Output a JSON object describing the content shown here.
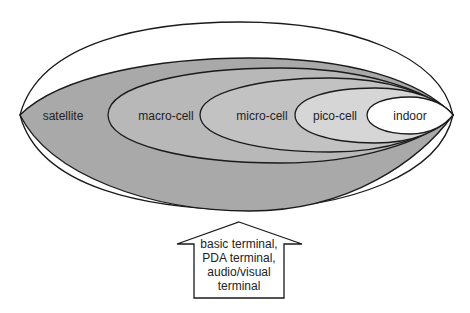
{
  "diagram": {
    "layers": [
      {
        "label": "satellite",
        "color": "#a9a9a9"
      },
      {
        "label": "macro-cell",
        "color": "#b8b8b8"
      },
      {
        "label": "micro-cell",
        "color": "#c2c2c2"
      },
      {
        "label": "pico-cell",
        "color": "#d6d6d6"
      },
      {
        "label": "indoor",
        "color": "#ffffff"
      }
    ],
    "outer_region_color": "#ffffff",
    "stroke_color": "#1a1a1a",
    "arrow": {
      "lines": [
        "basic terminal,",
        "PDA terminal,",
        "audio/visual",
        "terminal"
      ]
    }
  }
}
